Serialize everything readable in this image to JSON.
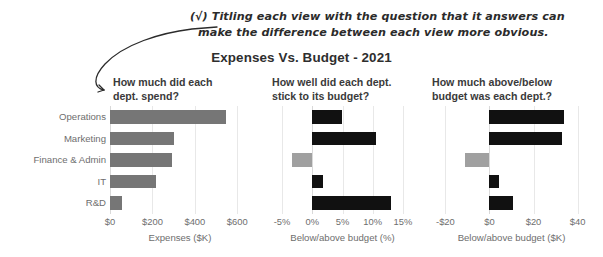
{
  "annotation": {
    "check": "(√)",
    "line1": "Titling each view with the question that it answers can",
    "line2": "make the difference between each view more obvious.",
    "arrow": "curved-arrow-icon"
  },
  "chart_data": {
    "type": "bar",
    "title": "Expenses Vs. Budget - 2021",
    "orientation": "horizontal",
    "layout": "small-multiples",
    "grid": true,
    "legend": null,
    "categories": [
      "Operations",
      "Marketing",
      "Finance & Admin",
      "IT",
      "R&D"
    ],
    "panels": [
      {
        "subtitle_line1": "How much did each",
        "subtitle_line2": "dept. spend?",
        "xlabel": "Expenses ($K)",
        "ticks": [
          "$0",
          "$200",
          "$400",
          "$600"
        ],
        "tick_values": [
          0,
          200,
          400,
          600
        ],
        "xlim": [
          0,
          660
        ],
        "values": [
          545,
          300,
          290,
          215,
          55
        ],
        "colors": [
          "#767676",
          "#767676",
          "#767676",
          "#767676",
          "#767676"
        ]
      },
      {
        "subtitle_line1": "How well did each dept.",
        "subtitle_line2": "stick to its budget?",
        "xlabel": "Below/above budget (%)",
        "ticks": [
          "-5%",
          "0%",
          "5%",
          "10%",
          "15%"
        ],
        "tick_values": [
          -5,
          0,
          5,
          10,
          15
        ],
        "xlim": [
          -7,
          17
        ],
        "values": [
          5.0,
          10.5,
          -3.3,
          1.7,
          13.0
        ],
        "colors": [
          "#111111",
          "#111111",
          "#a0a0a0",
          "#111111",
          "#111111"
        ]
      },
      {
        "subtitle_line1": "How much above/below",
        "subtitle_line2": "budget was each dept.?",
        "xlabel": "Below/above budget ($K)",
        "ticks": [
          "-$20",
          "$0",
          "$20",
          "$40"
        ],
        "tick_values": [
          -20,
          0,
          20,
          40
        ],
        "xlim": [
          -27,
          47
        ],
        "values": [
          34.0,
          33.0,
          -11.0,
          4.5,
          10.5
        ],
        "colors": [
          "#111111",
          "#111111",
          "#a0a0a0",
          "#111111",
          "#111111"
        ]
      }
    ]
  }
}
